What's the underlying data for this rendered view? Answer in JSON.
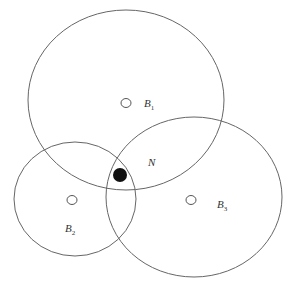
{
  "diagram": {
    "type": "circle-intersection",
    "colors": {
      "stroke": "#666666",
      "node_fill": "#111111",
      "background": "#ffffff"
    },
    "circles": [
      {
        "id": "B1",
        "label": "B",
        "subscript": "1",
        "cx": 126,
        "cy": 100,
        "rx": 98,
        "ry": 90,
        "beacon": {
          "cx": 126,
          "cy": 103
        },
        "label_pos": {
          "x": 144,
          "y": 107
        }
      },
      {
        "id": "B2",
        "label": "B",
        "subscript": "2",
        "cx": 75,
        "cy": 199,
        "rx": 61,
        "ry": 57,
        "beacon": {
          "cx": 72,
          "cy": 200
        },
        "label_pos": {
          "x": 65,
          "y": 232
        }
      },
      {
        "id": "B3",
        "label": "B",
        "subscript": "3",
        "cx": 194,
        "cy": 197,
        "rx": 88,
        "ry": 80,
        "beacon": {
          "cx": 191,
          "cy": 200
        },
        "label_pos": {
          "x": 217,
          "y": 208
        }
      }
    ],
    "node": {
      "id": "N",
      "label": "N",
      "cx": 120,
      "cy": 175,
      "r": 7,
      "label_pos": {
        "x": 148,
        "y": 166
      }
    }
  }
}
